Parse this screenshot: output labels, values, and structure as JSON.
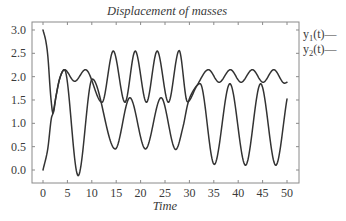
{
  "chart_data": {
    "type": "line",
    "title": "Displacement of masses",
    "xlabel": "Time",
    "ylabel": "",
    "xlim": [
      0,
      50
    ],
    "ylim": [
      -0.25,
      3.1
    ],
    "grid": false,
    "legend_position": "outside-right-top",
    "x_ticks": [
      0,
      5,
      10,
      15,
      20,
      25,
      30,
      35,
      40,
      45,
      50
    ],
    "x_tick_labels": [
      "0",
      "5",
      "10",
      "15",
      "20",
      "25",
      "30",
      "35",
      "40",
      "45",
      "50"
    ],
    "y_ticks": [
      0.0,
      0.5,
      1.0,
      1.5,
      2.0,
      2.5,
      3.0
    ],
    "y_tick_labels": [
      "0.0",
      "0.5",
      "1.0",
      "1.5",
      "2.0",
      "2.5",
      "3.0"
    ],
    "series": [
      {
        "name": "y1(t)",
        "label_base": "y",
        "label_sub": "1",
        "label_tail": "(t)—",
        "color": "#333333",
        "points": [
          [
            0,
            3.0
          ],
          [
            0.6,
            2.75
          ],
          [
            1.0,
            2.43
          ],
          [
            1.57,
            1.6
          ],
          [
            2.05,
            1.22
          ],
          [
            2.7,
            1.6
          ],
          [
            3.4,
            1.95
          ],
          [
            4.4,
            2.15
          ],
          [
            6.5,
            1.9
          ],
          [
            8.7,
            2.15
          ],
          [
            12.1,
            1.45
          ],
          [
            14.4,
            2.55
          ],
          [
            16.8,
            1.45
          ],
          [
            18.9,
            2.55
          ],
          [
            21.2,
            1.45
          ],
          [
            23.4,
            2.55
          ],
          [
            25.7,
            1.45
          ],
          [
            27.9,
            2.56
          ],
          [
            29.6,
            1.46
          ],
          [
            31.5,
            1.8
          ],
          [
            33.9,
            2.15
          ],
          [
            36.1,
            1.88
          ],
          [
            38.4,
            2.15
          ],
          [
            40.6,
            1.88
          ],
          [
            42.9,
            2.15
          ],
          [
            45.1,
            1.88
          ],
          [
            47.3,
            2.15
          ],
          [
            49.5,
            1.86
          ],
          [
            50,
            1.88
          ]
        ]
      },
      {
        "name": "y2(t)",
        "label_base": "y",
        "label_sub": "2",
        "label_tail": "(t)—",
        "color": "#333333",
        "points": [
          [
            0,
            0.0
          ],
          [
            1.0,
            0.47
          ],
          [
            1.7,
            1.1
          ],
          [
            2.05,
            1.22
          ],
          [
            2.7,
            1.6
          ],
          [
            3.4,
            1.95
          ],
          [
            4.4,
            2.15
          ],
          [
            7.2,
            -0.12
          ],
          [
            10.1,
            1.95
          ],
          [
            14.8,
            0.45
          ],
          [
            17.8,
            1.55
          ],
          [
            21.0,
            0.45
          ],
          [
            24.2,
            1.55
          ],
          [
            27.2,
            0.44
          ],
          [
            28.7,
            0.93
          ],
          [
            29.7,
            1.43
          ],
          [
            30.8,
            1.7
          ],
          [
            32.2,
            1.85
          ],
          [
            35.1,
            0.12
          ],
          [
            38.3,
            1.85
          ],
          [
            41.5,
            0.1
          ],
          [
            44.6,
            1.85
          ],
          [
            47.7,
            0.1
          ],
          [
            50,
            1.52
          ]
        ]
      }
    ]
  }
}
